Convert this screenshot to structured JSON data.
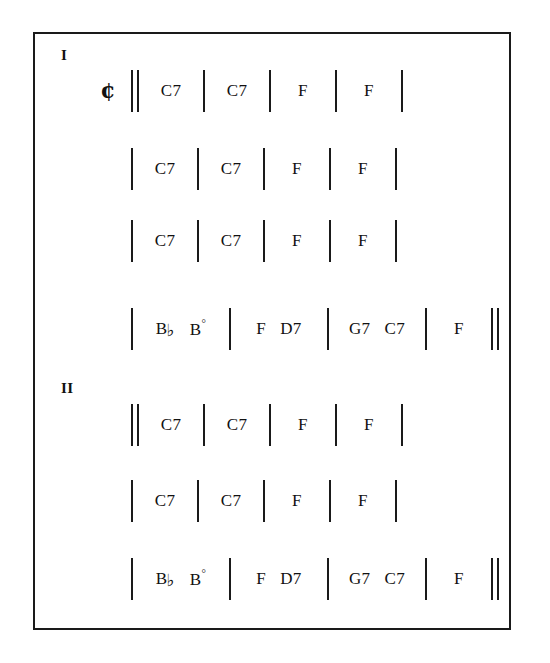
{
  "document": {
    "title": "Chord Chart",
    "frame_color": "#1a1a1a",
    "background_color": "#ffffff"
  },
  "sections": [
    {
      "label": "I",
      "lines": [
        {
          "meter": "¢",
          "open_barline": "double",
          "close_barline": "single",
          "measures": [
            {
              "chords": [
                {
                  "root": "C",
                  "quality": "7"
                }
              ]
            },
            {
              "chords": [
                {
                  "root": "C",
                  "quality": "7"
                }
              ]
            },
            {
              "chords": [
                {
                  "root": "F",
                  "quality": ""
                }
              ]
            },
            {
              "chords": [
                {
                  "root": "F",
                  "quality": ""
                }
              ]
            }
          ]
        },
        {
          "meter": "",
          "open_barline": "single",
          "close_barline": "single",
          "measures": [
            {
              "chords": [
                {
                  "root": "C",
                  "quality": "7"
                }
              ]
            },
            {
              "chords": [
                {
                  "root": "C",
                  "quality": "7"
                }
              ]
            },
            {
              "chords": [
                {
                  "root": "F",
                  "quality": ""
                }
              ]
            },
            {
              "chords": [
                {
                  "root": "F",
                  "quality": ""
                }
              ]
            }
          ]
        },
        {
          "meter": "",
          "open_barline": "single",
          "close_barline": "single",
          "measures": [
            {
              "chords": [
                {
                  "root": "C",
                  "quality": "7"
                }
              ]
            },
            {
              "chords": [
                {
                  "root": "C",
                  "quality": "7"
                }
              ]
            },
            {
              "chords": [
                {
                  "root": "F",
                  "quality": ""
                }
              ]
            },
            {
              "chords": [
                {
                  "root": "F",
                  "quality": ""
                }
              ]
            }
          ]
        },
        {
          "meter": "",
          "open_barline": "single",
          "close_barline": "double",
          "measures": [
            {
              "chords": [
                {
                  "root": "B",
                  "accidental": "♭",
                  "quality": ""
                },
                {
                  "root": "B",
                  "quality": "",
                  "dim": "°"
                }
              ]
            },
            {
              "chords": [
                {
                  "root": "F",
                  "quality": ""
                },
                {
                  "root": "D",
                  "quality": "7"
                }
              ]
            },
            {
              "chords": [
                {
                  "root": "G",
                  "quality": "7"
                },
                {
                  "root": "C",
                  "quality": "7"
                }
              ]
            },
            {
              "chords": [
                {
                  "root": "F",
                  "quality": ""
                }
              ]
            }
          ]
        }
      ]
    },
    {
      "label": "II",
      "lines": [
        {
          "meter": "",
          "open_barline": "double",
          "close_barline": "single",
          "measures": [
            {
              "chords": [
                {
                  "root": "C",
                  "quality": "7"
                }
              ]
            },
            {
              "chords": [
                {
                  "root": "C",
                  "quality": "7"
                }
              ]
            },
            {
              "chords": [
                {
                  "root": "F",
                  "quality": ""
                }
              ]
            },
            {
              "chords": [
                {
                  "root": "F",
                  "quality": ""
                }
              ]
            }
          ]
        },
        {
          "meter": "",
          "open_barline": "single",
          "close_barline": "single",
          "measures": [
            {
              "chords": [
                {
                  "root": "C",
                  "quality": "7"
                }
              ]
            },
            {
              "chords": [
                {
                  "root": "C",
                  "quality": "7"
                }
              ]
            },
            {
              "chords": [
                {
                  "root": "F",
                  "quality": ""
                }
              ]
            },
            {
              "chords": [
                {
                  "root": "F",
                  "quality": ""
                }
              ]
            }
          ]
        },
        {
          "meter": "",
          "open_barline": "single",
          "close_barline": "double",
          "measures": [
            {
              "chords": [
                {
                  "root": "B",
                  "accidental": "♭",
                  "quality": ""
                },
                {
                  "root": "B",
                  "quality": "",
                  "dim": "°"
                }
              ]
            },
            {
              "chords": [
                {
                  "root": "F",
                  "quality": ""
                },
                {
                  "root": "D",
                  "quality": "7"
                }
              ]
            },
            {
              "chords": [
                {
                  "root": "G",
                  "quality": "7"
                },
                {
                  "root": "C",
                  "quality": "7"
                }
              ]
            },
            {
              "chords": [
                {
                  "root": "F",
                  "quality": ""
                }
              ]
            }
          ]
        }
      ]
    }
  ],
  "layout": {
    "section_label_positions": [
      {
        "left": 26,
        "top": 14
      },
      {
        "left": 26,
        "top": 347
      }
    ],
    "line_tops": [
      34,
      112,
      184,
      272,
      368,
      444,
      522
    ],
    "line_lefts": [
      60,
      60,
      60,
      60,
      60,
      60,
      60
    ]
  }
}
